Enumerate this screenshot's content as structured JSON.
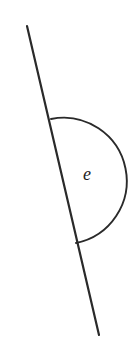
{
  "figure": {
    "type": "geometry-diagram",
    "width": 135,
    "height": 356,
    "background_color": "#ffffff",
    "ink_color": "#2a2a2a",
    "label_color": "#1d1d1d"
  },
  "line": {
    "name": "straight-line",
    "x1": 27,
    "y1": 26,
    "x2": 99,
    "y2": 335,
    "stroke_width": 2.2,
    "color": "#2a2a2a"
  },
  "arc": {
    "name": "angle-arc",
    "start_x": 51,
    "start_y": 119,
    "end_x": 76,
    "end_y": 243,
    "radius": 63,
    "extreme_x": 122,
    "extreme_y": 183,
    "side": "right",
    "sweep": 1,
    "large_arc": 1,
    "stroke_width": 1.9,
    "color": "#2a2a2a"
  },
  "label": {
    "name": "angle-label",
    "text": "e",
    "x": 87,
    "y": 176,
    "font_size": 18,
    "style": "italic-serif",
    "color": "#1d1d1d"
  }
}
